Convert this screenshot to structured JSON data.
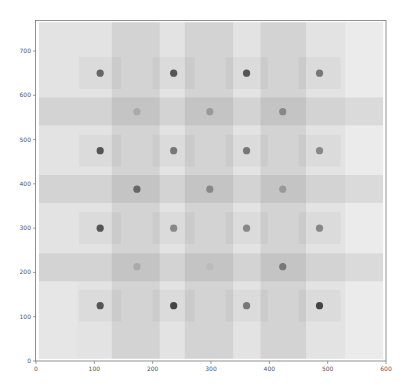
{
  "chart_data": {
    "type": "scatter",
    "title": "",
    "xlabel": "",
    "ylabel": "",
    "xlim": [
      0,
      600
    ],
    "ylim": [
      0,
      770
    ],
    "grid": false,
    "legend": null,
    "x_ticks": [
      0,
      100,
      200,
      300,
      400,
      500,
      600
    ],
    "y_ticks": [
      0,
      100,
      200,
      300,
      400,
      500,
      600,
      700
    ],
    "background_image": {
      "extent": [
        5,
        595,
        5,
        765
      ],
      "base_color": "#e3e3e3",
      "vertical_bands": [
        {
          "x0": 130,
          "x1": 212,
          "color": "#d2d2d2"
        },
        {
          "x0": 255,
          "x1": 338,
          "color": "#d2d2d2"
        },
        {
          "x0": 385,
          "x1": 463,
          "color": "#d4d4d4"
        }
      ],
      "horizontal_bands": [
        {
          "y0": 532,
          "y1": 595,
          "color": "#d2d2d2"
        },
        {
          "y0": 357,
          "y1": 420,
          "color": "#d2d2d2"
        },
        {
          "y0": 180,
          "y1": 243,
          "color": "#d4d4d4"
        }
      ],
      "light_patches": [
        {
          "x0": 530,
          "x1": 595,
          "y0": 5,
          "y1": 765,
          "color": "#ebebeb"
        },
        {
          "x0": 5,
          "x1": 70,
          "y0": 5,
          "y1": 180,
          "color": "#e6e6e6"
        }
      ]
    },
    "series": [
      {
        "name": "grid-A",
        "points": [
          {
            "x": 110,
            "y": 650,
            "shade": "#666666"
          },
          {
            "x": 236,
            "y": 650,
            "shade": "#555555"
          },
          {
            "x": 361,
            "y": 650,
            "shade": "#555555"
          },
          {
            "x": 486,
            "y": 650,
            "shade": "#777777"
          },
          {
            "x": 110,
            "y": 475,
            "shade": "#555555"
          },
          {
            "x": 236,
            "y": 475,
            "shade": "#777777"
          },
          {
            "x": 361,
            "y": 475,
            "shade": "#777777"
          },
          {
            "x": 486,
            "y": 475,
            "shade": "#888888"
          },
          {
            "x": 110,
            "y": 300,
            "shade": "#555555"
          },
          {
            "x": 236,
            "y": 300,
            "shade": "#888888"
          },
          {
            "x": 361,
            "y": 300,
            "shade": "#888888"
          },
          {
            "x": 486,
            "y": 300,
            "shade": "#888888"
          },
          {
            "x": 110,
            "y": 125,
            "shade": "#555555"
          },
          {
            "x": 236,
            "y": 125,
            "shade": "#444444"
          },
          {
            "x": 361,
            "y": 125,
            "shade": "#777777"
          },
          {
            "x": 486,
            "y": 125,
            "shade": "#444444"
          }
        ]
      },
      {
        "name": "grid-B",
        "points": [
          {
            "x": 173,
            "y": 563,
            "shade": "#aaaaaa"
          },
          {
            "x": 298,
            "y": 563,
            "shade": "#999999"
          },
          {
            "x": 423,
            "y": 563,
            "shade": "#888888"
          },
          {
            "x": 173,
            "y": 388,
            "shade": "#666666"
          },
          {
            "x": 298,
            "y": 388,
            "shade": "#888888"
          },
          {
            "x": 423,
            "y": 388,
            "shade": "#999999"
          },
          {
            "x": 173,
            "y": 213,
            "shade": "#aaaaaa"
          },
          {
            "x": 298,
            "y": 213,
            "shade": "#bbbbbb"
          },
          {
            "x": 423,
            "y": 213,
            "shade": "#777777"
          }
        ]
      }
    ]
  },
  "axes": {
    "x_tick_labels": [
      "0",
      "100",
      "200",
      "300",
      "400",
      "500",
      "600"
    ],
    "y_tick_labels": [
      "0",
      "100",
      "200",
      "300",
      "400",
      "500",
      "600",
      "700"
    ]
  }
}
